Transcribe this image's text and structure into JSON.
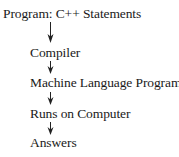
{
  "diagram": {
    "type": "flowchart-vertical",
    "nodes": [
      {
        "id": "program",
        "label": "Program: C++ Statements"
      },
      {
        "id": "compiler",
        "label": "Compiler"
      },
      {
        "id": "machine",
        "label": "Machine Language Program"
      },
      {
        "id": "runs",
        "label": "Runs on Computer"
      },
      {
        "id": "answers",
        "label": "Answers"
      }
    ],
    "edges": [
      {
        "from": "program",
        "to": "compiler",
        "icon": "arrow-down-icon"
      },
      {
        "from": "compiler",
        "to": "machine",
        "icon": "arrow-down-icon"
      },
      {
        "from": "machine",
        "to": "runs",
        "icon": "arrow-down-icon"
      },
      {
        "from": "runs",
        "to": "answers",
        "icon": "arrow-down-icon"
      }
    ],
    "colors": {
      "text": "#1a1a1a",
      "arrow": "#222222",
      "background": "#ffffff"
    }
  }
}
